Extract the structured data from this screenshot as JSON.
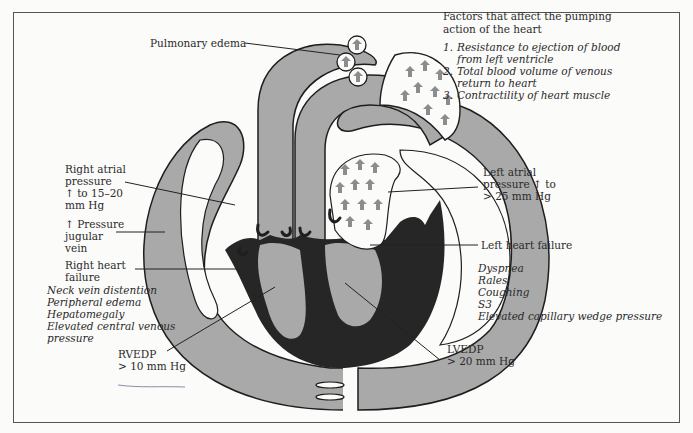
{
  "diagram": {
    "colors": {
      "vessel_fill": "#a9a9a9",
      "muscle_fill": "#262626",
      "outline": "#1e1e1e",
      "arrow_fill": "#8c8c8c",
      "frame": "#555555",
      "background": "#fbfbfa"
    }
  },
  "labels": {
    "pulmonary_edema": "Pulmonary edema",
    "right_atrial_pressure": [
      "Right atrial",
      "pressure",
      "↑ to 15–20",
      "mm Hg"
    ],
    "pressure_jugular_vein": [
      "↑ Pressure",
      "jugular",
      "vein"
    ],
    "right_heart_failure": [
      "Right heart",
      "failure"
    ],
    "right_signs": [
      "Neck vein distention",
      "Peripheral edema",
      "Hepatomegaly",
      "Elevated central venous",
      "pressure"
    ],
    "rvedp": [
      "RVEDP",
      "> 10 mm Hg"
    ],
    "left_atrial_pressure": [
      "Left atrial",
      "pressure ↑ to",
      "> 25 mm Hg"
    ],
    "left_heart_failure": "Left heart failure",
    "left_signs": [
      "Dyspnea",
      "Rales",
      "Coughing",
      "S3",
      "Elevated capillary wedge pressure"
    ],
    "lvedp": [
      "LVEDP",
      "> 20 mm Hg"
    ]
  },
  "factors": {
    "heading": [
      "Factors that affect the pumping",
      "action of the heart"
    ],
    "items": [
      {
        "num": "1.",
        "lines": [
          "Resistance to ejection of blood",
          "from left ventricle"
        ]
      },
      {
        "num": "2.",
        "lines": [
          "Total blood volume of venous",
          "return to heart"
        ]
      },
      {
        "num": "3.",
        "lines": [
          "Contractility of heart muscle"
        ]
      }
    ]
  },
  "icons": {
    "flow_arrow": "upward-arrow-glyph",
    "alveoli_circle": "circle-with-arrow"
  }
}
